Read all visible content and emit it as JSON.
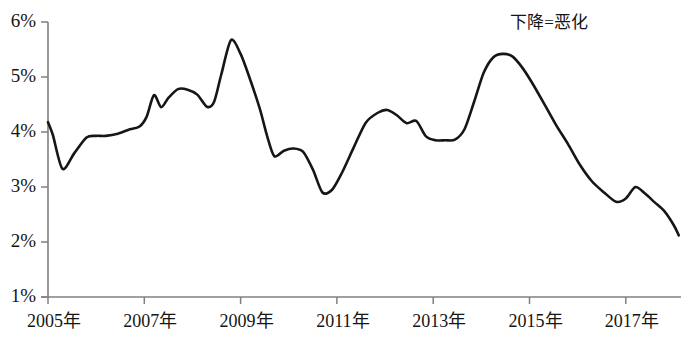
{
  "chart_data": {
    "type": "line",
    "title": "",
    "subtitle": "",
    "xlabel": "",
    "ylabel": "",
    "annotations": [
      {
        "text": "下降=恶化",
        "x_px": 549,
        "y_px": 22
      }
    ],
    "legend": [],
    "legend_position": "none",
    "grid": false,
    "ylim": [
      1,
      6
    ],
    "ytick_values": [
      6,
      5,
      4,
      3,
      2,
      1
    ],
    "ytick_labels": [
      "6%",
      "5%",
      "4%",
      "3%",
      "2%",
      "1%"
    ],
    "xlim": [
      2005.0,
      2018.1
    ],
    "xtick_values": [
      2005,
      2007,
      2009,
      2011,
      2013,
      2015,
      2017
    ],
    "xtick_labels": [
      "2005年",
      "2007年",
      "2009年",
      "2011年",
      "2013年",
      "2015年",
      "2017年"
    ],
    "series": [
      {
        "name": "series-1",
        "color": "#161616",
        "x": [
          2005.0,
          2005.1,
          2005.3,
          2005.55,
          2005.8,
          2006.0,
          2006.2,
          2006.45,
          2006.7,
          2006.9,
          2007.05,
          2007.2,
          2007.35,
          2007.5,
          2007.7,
          2007.9,
          2008.1,
          2008.3,
          2008.45,
          2008.6,
          2008.8,
          2009.0,
          2009.2,
          2009.4,
          2009.55,
          2009.7,
          2009.9,
          2010.1,
          2010.3,
          2010.5,
          2010.7,
          2010.9,
          2011.1,
          2011.35,
          2011.6,
          2011.85,
          2012.05,
          2012.25,
          2012.45,
          2012.65,
          2012.85,
          2013.05,
          2013.25,
          2013.45,
          2013.65,
          2013.85,
          2014.05,
          2014.25,
          2014.45,
          2014.65,
          2014.85,
          2015.05,
          2015.3,
          2015.55,
          2015.8,
          2016.05,
          2016.3,
          2016.55,
          2016.8,
          2017.0,
          2017.2,
          2017.4,
          2017.6,
          2017.8,
          2018.0,
          2018.1
        ],
        "y": [
          4.18,
          3.95,
          3.33,
          3.62,
          3.9,
          3.93,
          3.93,
          3.97,
          4.05,
          4.1,
          4.28,
          4.67,
          4.45,
          4.62,
          4.78,
          4.77,
          4.68,
          4.46,
          4.55,
          5.05,
          5.67,
          5.42,
          4.95,
          4.42,
          3.93,
          3.56,
          3.66,
          3.7,
          3.64,
          3.32,
          2.9,
          2.95,
          3.25,
          3.72,
          4.17,
          4.35,
          4.4,
          4.3,
          4.16,
          4.2,
          3.92,
          3.85,
          3.85,
          3.86,
          4.05,
          4.55,
          5.08,
          5.36,
          5.42,
          5.37,
          5.17,
          4.9,
          4.52,
          4.13,
          3.78,
          3.4,
          3.1,
          2.9,
          2.73,
          2.79,
          3.0,
          2.88,
          2.72,
          2.56,
          2.3,
          2.12
        ]
      }
    ]
  },
  "axes": {
    "y_ticks": [
      {
        "label": "6%",
        "value": 6
      },
      {
        "label": "5%",
        "value": 5
      },
      {
        "label": "4%",
        "value": 4
      },
      {
        "label": "3%",
        "value": 3
      },
      {
        "label": "2%",
        "value": 2
      },
      {
        "label": "1%",
        "value": 1
      }
    ],
    "x_ticks": [
      {
        "label": "2005年",
        "value": 2005
      },
      {
        "label": "2007年",
        "value": 2007
      },
      {
        "label": "2009年",
        "value": 2009
      },
      {
        "label": "2011年",
        "value": 2011
      },
      {
        "label": "2013年",
        "value": 2013
      },
      {
        "label": "2015年",
        "value": 2015
      },
      {
        "label": "2017年",
        "value": 2017
      }
    ]
  },
  "annotation": {
    "note_label": "下降=恶化"
  },
  "colors": {
    "line": "#161616",
    "axis": "#808080",
    "text": "#151515",
    "background": "#ffffff"
  }
}
